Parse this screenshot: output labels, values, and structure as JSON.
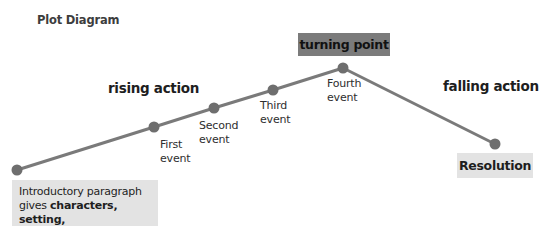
{
  "title": "Plot Diagram",
  "colors": {
    "line": "#7a7a7a",
    "dot": "#6e6e6e",
    "turning_box": "#7b7b7b",
    "label_box": "#e3e3e3"
  },
  "stages": {
    "rising": "rising action",
    "falling": "falling action",
    "climax": "turning point",
    "resolution": "Resolution"
  },
  "events": [
    {
      "line1": "First",
      "line2": "event"
    },
    {
      "line1": "Second",
      "line2": "event"
    },
    {
      "line1": "Third",
      "line2": "event"
    },
    {
      "line1": "Fourth",
      "line2": "event"
    }
  ],
  "intro": {
    "line1": "Introductory paragraph",
    "line2_prefix": "gives ",
    "line2_bold": "characters, setting,",
    "line3_prefix": "and ",
    "line3_bold": "conflict"
  },
  "plot_points": [
    "introduction",
    "first-event",
    "second-event",
    "third-event",
    "fourth-event",
    "resolution"
  ]
}
